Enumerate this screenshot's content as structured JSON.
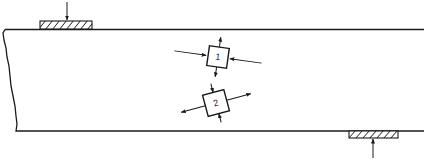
{
  "diagram": {
    "type": "beam-stress-elements",
    "colors": {
      "ink": "#1a1a1a",
      "background": "#ffffff"
    },
    "beam": {
      "top_y": 29,
      "bottom_y": 131,
      "left_edge": "break-line",
      "right_edge": "open"
    },
    "supports": [
      {
        "id": "top-load-pad",
        "position": "top",
        "x": 40,
        "width": 52,
        "hatched": true,
        "arrow_direction": "down"
      },
      {
        "id": "bottom-reaction-pad",
        "position": "bottom",
        "x": 349,
        "width": 49,
        "hatched": true,
        "arrow_direction": "up"
      }
    ],
    "elements": [
      {
        "label": "1",
        "cx": 218,
        "cy": 57,
        "rotation_deg": 8,
        "horizontal_arrows": "inward",
        "vertical_arrows": "outward"
      },
      {
        "label": "2",
        "cx": 216,
        "cy": 103,
        "rotation_deg": -15,
        "horizontal_arrows": "outward",
        "vertical_arrows": "inward"
      }
    ]
  }
}
